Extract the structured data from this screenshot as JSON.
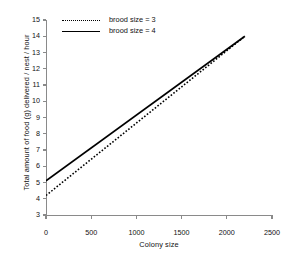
{
  "chart_data": {
    "type": "line",
    "title": "",
    "xlabel": "Colony size",
    "ylabel": "Total amount of food (g) delivered / nest / hour",
    "xlim": [
      0,
      2500
    ],
    "ylim": [
      3,
      15
    ],
    "xticks": [
      0,
      500,
      1000,
      1500,
      2000,
      2500
    ],
    "yticks": [
      3,
      4,
      5,
      6,
      7,
      8,
      9,
      10,
      11,
      12,
      13,
      14,
      15
    ],
    "grid": false,
    "legend_position": "top-left",
    "series": [
      {
        "name": "brood size = 3",
        "style": "dotted",
        "color": "#000000",
        "x": [
          0,
          2200
        ],
        "values": [
          4.2,
          14.0
        ]
      },
      {
        "name": "brood size = 4",
        "style": "solid",
        "color": "#000000",
        "x": [
          0,
          2200
        ],
        "values": [
          5.1,
          14.0
        ]
      }
    ]
  },
  "axes": {
    "x_title": "Colony size",
    "y_title": "Total amount of food (g) delivered / nest / hour",
    "x_tick_labels": [
      "0",
      "500",
      "1000",
      "1500",
      "2000",
      "2500"
    ],
    "y_tick_labels": [
      "3",
      "4",
      "5",
      "6",
      "7",
      "8",
      "9",
      "10",
      "11",
      "12",
      "13",
      "14",
      "15"
    ],
    "axis_color": "#8a8a8a"
  },
  "legend": {
    "entries": [
      {
        "label": "brood size = 3",
        "style": "dotted"
      },
      {
        "label": "brood size = 4",
        "style": "solid"
      }
    ]
  }
}
